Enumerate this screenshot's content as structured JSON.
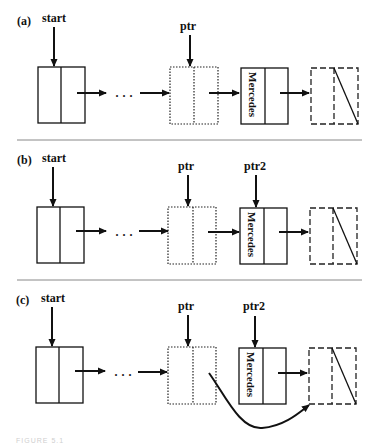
{
  "figure": {
    "caption": "FIGURE 5.1",
    "panels": [
      {
        "id": "a",
        "label": "(a)",
        "pointers": [
          {
            "name": "start",
            "target": "first-node"
          },
          {
            "name": "ptr",
            "target": "previous-node"
          }
        ],
        "nodes": [
          {
            "role": "first-node",
            "style": "solid",
            "data": ""
          },
          {
            "role": "ellipsis",
            "text": "…"
          },
          {
            "role": "previous-node",
            "style": "dotted",
            "data": ""
          },
          {
            "role": "target-node",
            "style": "solid",
            "data": "Mercedes"
          },
          {
            "role": "next-node",
            "style": "dashed",
            "data": "",
            "null_link": true
          }
        ]
      },
      {
        "id": "b",
        "label": "(b)",
        "pointers": [
          {
            "name": "start",
            "target": "first-node"
          },
          {
            "name": "ptr",
            "target": "previous-node"
          },
          {
            "name": "ptr2",
            "target": "target-node"
          }
        ],
        "nodes": [
          {
            "role": "first-node",
            "style": "solid",
            "data": ""
          },
          {
            "role": "ellipsis",
            "text": "…"
          },
          {
            "role": "previous-node",
            "style": "dotted",
            "data": ""
          },
          {
            "role": "target-node",
            "style": "solid",
            "data": "Mercedes"
          },
          {
            "role": "next-node",
            "style": "dashed",
            "data": "",
            "null_link": true
          }
        ]
      },
      {
        "id": "c",
        "label": "(c)",
        "pointers": [
          {
            "name": "start",
            "target": "first-node"
          },
          {
            "name": "ptr",
            "target": "previous-node"
          },
          {
            "name": "ptr2",
            "target": "target-node"
          }
        ],
        "nodes": [
          {
            "role": "first-node",
            "style": "solid",
            "data": ""
          },
          {
            "role": "ellipsis",
            "text": "…"
          },
          {
            "role": "previous-node",
            "style": "dotted",
            "data": "",
            "link_bypasses_to": "next-node"
          },
          {
            "role": "target-node",
            "style": "solid",
            "data": "Mercedes"
          },
          {
            "role": "next-node",
            "style": "dashed",
            "data": "",
            "null_link": true
          }
        ]
      }
    ]
  },
  "labels": {
    "a": "(a)",
    "b": "(b)",
    "c": "(c)",
    "start": "start",
    "ptr": "ptr",
    "ptr2": "ptr2",
    "mercedes": "Mercedes",
    "ellipsis": "· · ·"
  },
  "colors": {
    "line": "#111111",
    "separator": "#888888",
    "background": "#ffffff"
  }
}
